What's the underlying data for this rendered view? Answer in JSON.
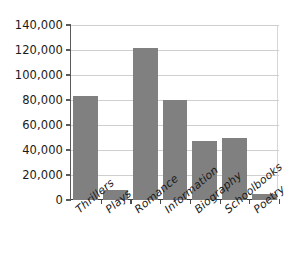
{
  "chart_data": {
    "type": "bar",
    "title": "",
    "subtitle": "",
    "xlabel": "",
    "ylabel": "",
    "categories": [
      "Thrillers",
      "Plays",
      "Romance",
      "Information",
      "Biography",
      "Schoolbooks",
      "Poetry"
    ],
    "values": [
      83500,
      8000,
      122000,
      80000,
      47000,
      49500,
      5000
    ],
    "ylim": [
      0,
      140000
    ],
    "yticks": [
      0,
      20000,
      40000,
      60000,
      80000,
      100000,
      120000,
      140000
    ],
    "ytick_labels": [
      "0",
      "20,000",
      "40,000",
      "60,000",
      "80,000",
      "100,000",
      "120,000",
      "140,000"
    ],
    "grid": true,
    "legend": false,
    "legend_position": "none",
    "series": [
      {
        "name": "Books",
        "values": [
          83500,
          8000,
          122000,
          80000,
          47000,
          49500,
          5000
        ]
      }
    ]
  },
  "style": {
    "bar_color": "#808080",
    "gridline_color": "#cfcfcf",
    "axis_color": "#4a4a4a",
    "background_color": "#ffffff",
    "text_color": "#1a1a1a"
  }
}
